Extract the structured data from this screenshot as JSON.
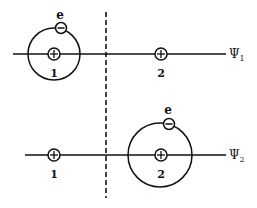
{
  "diagram": {
    "colors": {
      "ink": "#111111",
      "background": "#ffffff"
    },
    "divider": {
      "style": "dashed",
      "x": 106,
      "y1": 12,
      "y2": 198
    },
    "states": [
      {
        "wavefunction_label": "Ψ",
        "wavefunction_sub": "1",
        "axis_y": 54,
        "line_x1": 13,
        "line_x2": 226,
        "protons": [
          {
            "label": "1",
            "cx": 54,
            "cy": 54,
            "symbol": "+"
          },
          {
            "label": "2",
            "cx": 161,
            "cy": 54,
            "symbol": "+"
          }
        ],
        "orbit": {
          "cx": 54,
          "cy": 54,
          "r": 26
        },
        "electron": {
          "label": "e",
          "cx": 61,
          "cy": 28,
          "symbol": "−"
        }
      },
      {
        "wavefunction_label": "Ψ",
        "wavefunction_sub": "2",
        "axis_y": 155,
        "line_x1": 25,
        "line_x2": 226,
        "protons": [
          {
            "label": "1",
            "cx": 54,
            "cy": 155,
            "symbol": "+"
          },
          {
            "label": "2",
            "cx": 161,
            "cy": 155,
            "symbol": "+"
          }
        ],
        "orbit": {
          "cx": 160,
          "cy": 155,
          "r": 32
        },
        "electron": {
          "label": "e",
          "cx": 169,
          "cy": 124,
          "symbol": "−"
        }
      }
    ]
  }
}
